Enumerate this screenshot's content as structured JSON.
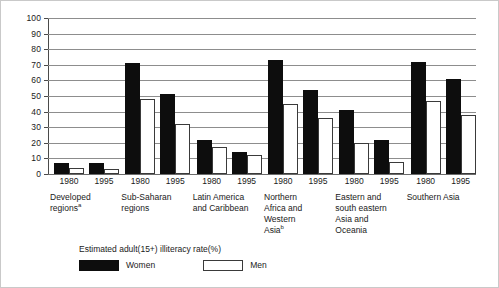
{
  "chart_data": {
    "type": "bar",
    "title": "",
    "subtitle": "",
    "xlabel": "",
    "ylabel": "",
    "ylim": [
      0,
      100
    ],
    "ytick_labels": [
      "100",
      "90",
      "80",
      "70",
      "60",
      "50",
      "40",
      "30",
      "20",
      "10",
      "0"
    ],
    "ytick_values": [
      100,
      90,
      80,
      70,
      60,
      50,
      40,
      30,
      20,
      10,
      0
    ],
    "grid": true,
    "legend_position": "below-plot-left",
    "legend_title": "Estimated adult(15+) illiteracy rate(%)",
    "categories": [
      "Developed regionsᵃ 1980",
      "Developed regionsᵃ 1995",
      "Sub-Saharan regions 1980",
      "Sub-Saharan regions 1995",
      "Latin America and Caribbean 1980",
      "Latin America and Caribbean 1995",
      "Northern Africa and Western Asiaᵇ 1980",
      "Northern Africa and Western Asiaᵇ 1995",
      "Eastern and south eastern Asia and Oceania 1980",
      "Eastern and south eastern Asia and Oceania 1995",
      "Southern Asia 1980",
      "Southern Asia 1995"
    ],
    "series": [
      {
        "name": "Women",
        "color": "#0d0d0d",
        "values": [
          7,
          7,
          71,
          51,
          22,
          14,
          73,
          54,
          41,
          22,
          72,
          61
        ]
      },
      {
        "name": "Men",
        "color": "#ffffff",
        "values": [
          4,
          3.5,
          48,
          32,
          17,
          12,
          45,
          36,
          20,
          8,
          47,
          38
        ]
      }
    ],
    "groups": [
      {
        "region": "Developed",
        "region_line2": "regions",
        "footnote": "a",
        "years": [
          "1980",
          "1995"
        ],
        "women": [
          7,
          7
        ],
        "men": [
          4,
          3.5
        ]
      },
      {
        "region": "Sub-Saharan",
        "region_line2": "regions",
        "footnote": "",
        "years": [
          "1980",
          "1995"
        ],
        "women": [
          71,
          51
        ],
        "men": [
          48,
          32
        ]
      },
      {
        "region": "Latin America",
        "region_line2": "and Caribbean",
        "footnote": "",
        "years": [
          "1980",
          "1995"
        ],
        "women": [
          22,
          14
        ],
        "men": [
          17,
          12
        ]
      },
      {
        "region": "Northern",
        "region_line2": "Africa and",
        "region_line3": "Western",
        "region_line4": "Asia",
        "footnote": "b",
        "years": [
          "1980",
          "1995"
        ],
        "women": [
          73,
          54
        ],
        "men": [
          45,
          36
        ]
      },
      {
        "region": "Eastern and",
        "region_line2": "south eastern",
        "region_line3": "Asia and",
        "region_line4": "Oceania",
        "footnote": "",
        "years": [
          "1980",
          "1995"
        ],
        "women": [
          41,
          22
        ],
        "men": [
          20,
          8
        ]
      },
      {
        "region": "Southern Asia",
        "region_line2": "",
        "footnote": "",
        "years": [
          "1980",
          "1995"
        ],
        "women": [
          72,
          61
        ],
        "men": [
          47,
          38
        ]
      }
    ]
  },
  "yaxis": {
    "ticks": [
      {
        "label": "100",
        "value": 100
      },
      {
        "label": "90",
        "value": 90
      },
      {
        "label": "80",
        "value": 80
      },
      {
        "label": "70",
        "value": 70
      },
      {
        "label": "60",
        "value": 60
      },
      {
        "label": "50",
        "value": 50
      },
      {
        "label": "40",
        "value": 40
      },
      {
        "label": "30",
        "value": 30
      },
      {
        "label": "20",
        "value": 20
      },
      {
        "label": "10",
        "value": 10
      },
      {
        "label": "0",
        "value": 0
      }
    ]
  },
  "xaxis": {
    "years": [
      "1980",
      "1995",
      "1980",
      "1995",
      "1980",
      "1995",
      "1980",
      "1995",
      "1980",
      "1995",
      "1980",
      "1995"
    ],
    "group_labels": [
      {
        "lines": [
          "Developed",
          "regions"
        ],
        "footnote": "a"
      },
      {
        "lines": [
          "Sub-Saharan",
          "regions"
        ],
        "footnote": ""
      },
      {
        "lines": [
          "Latin America",
          "and Caribbean"
        ],
        "footnote": ""
      },
      {
        "lines": [
          "Northern",
          "Africa and",
          "Western",
          "Asia"
        ],
        "footnote": "b"
      },
      {
        "lines": [
          "Eastern and",
          "south eastern",
          "Asia and",
          "Oceania"
        ],
        "footnote": ""
      },
      {
        "lines": [
          "Southern Asia"
        ],
        "footnote": ""
      }
    ]
  },
  "legend": {
    "title": "Estimated adult(15+) illiteracy rate(%)",
    "women_label": "Women",
    "men_label": "Men"
  }
}
